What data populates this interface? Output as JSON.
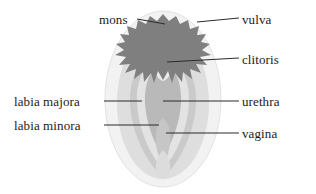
{
  "figure": {
    "background_color": "#ffffff",
    "leader_line_color": "#2b2b2b",
    "label_color": "#1a1a1a"
  },
  "labels": {
    "mons": "mons",
    "vulva": "vulva",
    "clitoris": "clitoris",
    "labia_majora": "labia majora",
    "labia_minora": "labia minora",
    "urethra": "urethra",
    "vagina": "vagina"
  },
  "anatomy_regions": [
    {
      "name": "vulva",
      "description": "outermost pale oval",
      "color": "#f0f0f0"
    },
    {
      "name": "labia-majora",
      "description": "light gray rounded mound",
      "color": "#dcdcdc"
    },
    {
      "name": "labia-minora",
      "description": "mid gray inner folds",
      "color": "#cacaca"
    },
    {
      "name": "vestibule",
      "description": "lighter inner channel",
      "color": "#e4e4e4"
    },
    {
      "name": "mons",
      "description": "dark gray jagged pubic hair region",
      "color": "#7e7e7e"
    },
    {
      "name": "clitoris",
      "description": "small pale rounded nub near top",
      "color": "#e8e8e8"
    },
    {
      "name": "urethra",
      "description": "mid region of inner vestibule",
      "color": "#b8b8b8"
    },
    {
      "name": "vagina",
      "description": "lower opening within vestibule",
      "color": "#c4c4c4"
    }
  ]
}
